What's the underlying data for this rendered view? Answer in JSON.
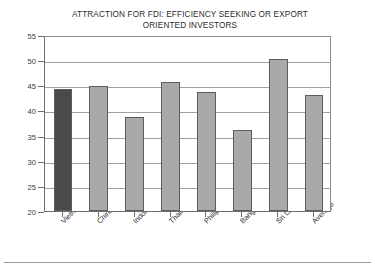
{
  "chart_data": {
    "type": "bar",
    "title": "ATTRACTION FOR FDI: EFFICIENCY SEEKING OR EXPORT ORIENTED INVESTORS",
    "title_line1": "ATTRACTION FOR FDI: EFFICIENCY SEEKING OR EXPORT",
    "title_line2": "ORIENTED INVESTORS",
    "xlabel": "",
    "ylabel": "",
    "categories": [
      "Vietnam",
      "China",
      "Indonesia",
      "Thailand",
      "Philippines",
      "Bangladesh",
      "Sri Lanka",
      "Average"
    ],
    "values": [
      44.2,
      44.8,
      38.6,
      45.7,
      43.7,
      36.1,
      50.2,
      43.1
    ],
    "ylim": [
      20,
      55
    ],
    "ytick_labels": [
      "55",
      "50",
      "45",
      "40",
      "35",
      "30",
      "25",
      "20"
    ],
    "ytick_values": [
      55,
      50,
      45,
      40,
      35,
      30,
      25,
      20
    ],
    "grid": true,
    "grid_axis": "y",
    "legend": "none",
    "bar_colors": [
      "#4a4a4a",
      "#a9a9a9",
      "#a9a9a9",
      "#a9a9a9",
      "#a9a9a9",
      "#a9a9a9",
      "#a9a9a9",
      "#a9a9a9"
    ],
    "highlight_category": "Vietnam",
    "colors": {
      "highlight_bar": "#4a4a4a",
      "default_bar": "#a9a9a9",
      "bar_border": "#5d5d5d",
      "gridline": "#a0a0a0",
      "axis": "#6e6e6e",
      "text": "#2b2b2b",
      "background": "#ffffff"
    }
  }
}
